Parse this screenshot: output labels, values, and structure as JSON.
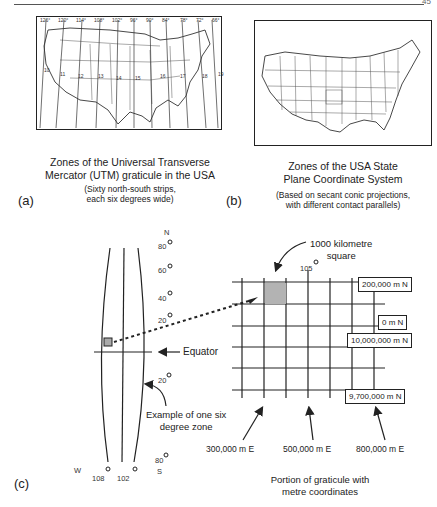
{
  "page": {
    "page_number": "45"
  },
  "panel_a": {
    "label": "(a)",
    "caption_line1": "Zones of the Universal Transverse",
    "caption_line2": "Mercator (UTM) graticule in the USA",
    "sub_line1": "(Sixty north-south strips,",
    "sub_line2": "each six degrees wide)",
    "longitudes": [
      "126°",
      "120°",
      "114°",
      "108°",
      "102°",
      "96°",
      "90°",
      "84°",
      "78°",
      "72°",
      "66°"
    ],
    "zones": [
      "10",
      "11",
      "12",
      "13",
      "14",
      "15",
      "16",
      "17",
      "18",
      "19"
    ]
  },
  "panel_b": {
    "label": "(b)",
    "caption_line1": "Zones of the USA State",
    "caption_line2": "Plane Coordinate System",
    "sub_line1": "(Based on secant conic projections,",
    "sub_line2": "with different contact  parallels)"
  },
  "panel_c": {
    "label": "(c)",
    "north_label": "N",
    "south_label": "S",
    "west_label": "W",
    "lat_north": [
      "80",
      "60",
      "40",
      "20"
    ],
    "lat_south": [
      "20",
      "80"
    ],
    "lon_bottom": [
      "108",
      "102"
    ],
    "equator_label": "Equator",
    "zone_example_line1": "Example of one six",
    "zone_example_line2": "degree zone",
    "km_square_line1": "1000 kilometre",
    "km_square_line2": "square",
    "central_meridian": "105",
    "northings": [
      "200,000 m N",
      "0 m N",
      "10,000,000 m N",
      "9,700,000 m N"
    ],
    "eastings": [
      "300,000 m E",
      "500,000 m E",
      "800,000 m E"
    ],
    "caption_line1": "Portion of graticule with",
    "caption_line2": "metre coordinates"
  }
}
